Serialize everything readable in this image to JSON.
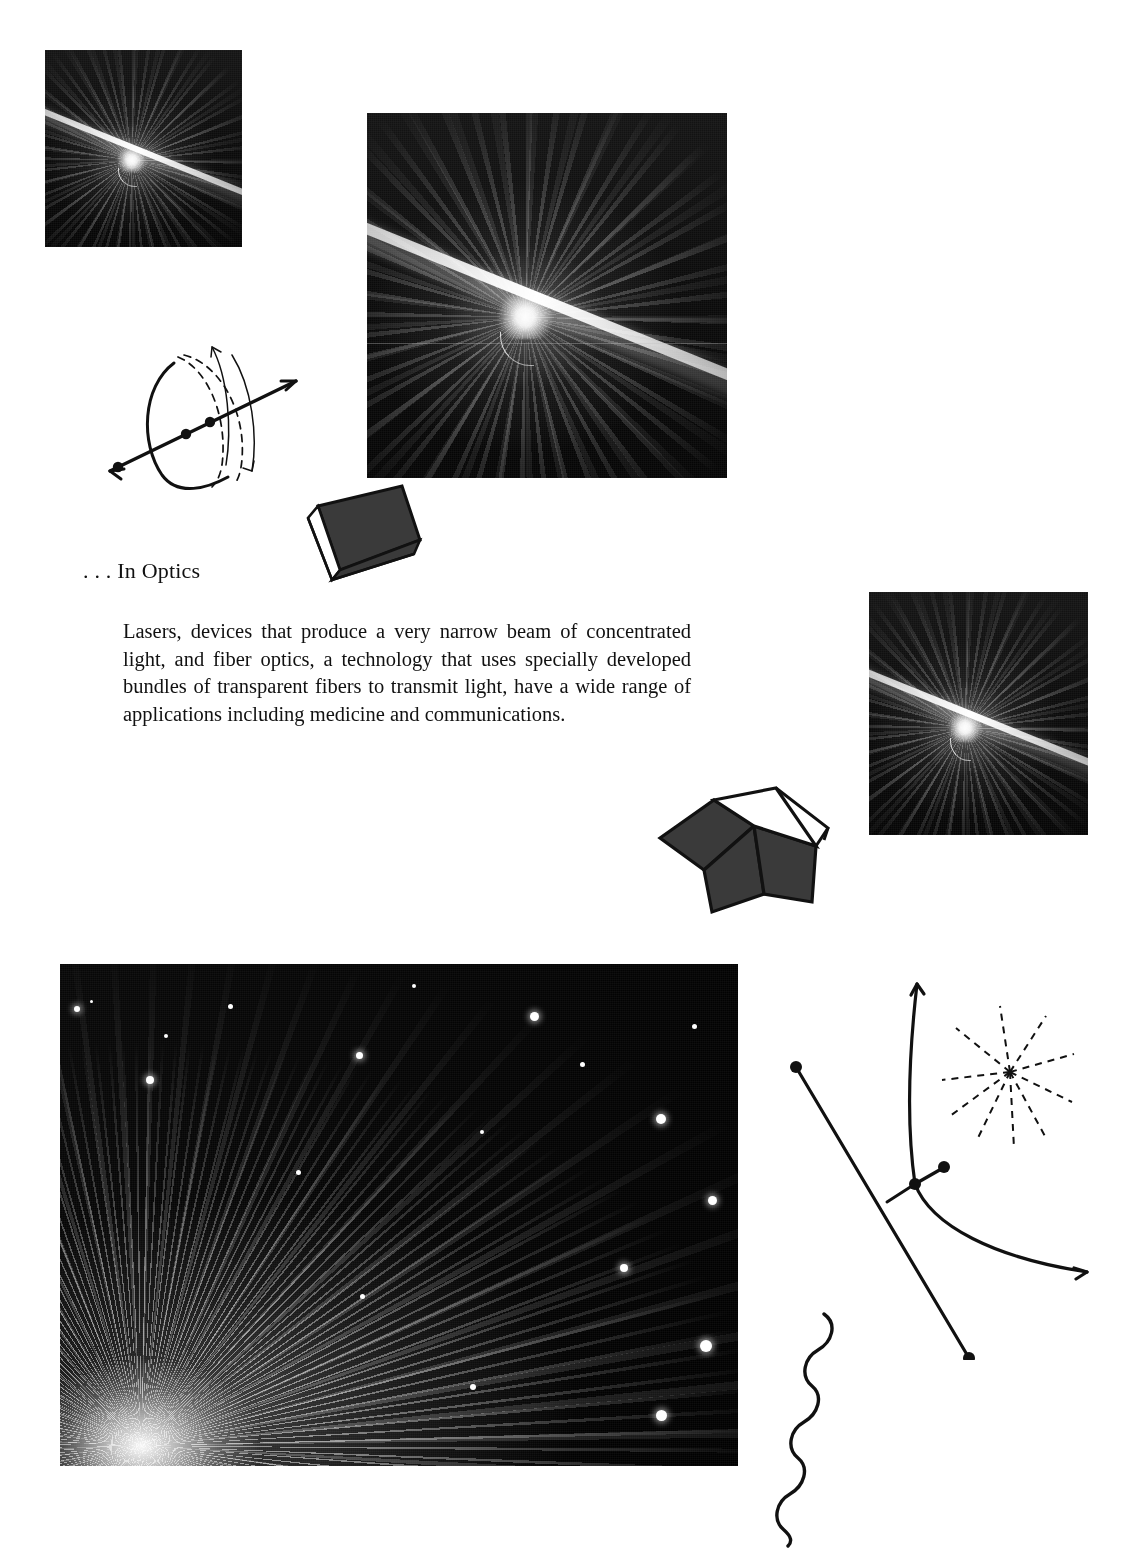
{
  "page": {
    "background_color": "#ffffff",
    "width": 1133,
    "height": 1568
  },
  "heading": {
    "text": ". . . In Optics"
  },
  "body": {
    "paragraph": "Lasers, devices that produce a very narrow beam of concentrated light, and fiber optics, a technology that uses specially developed bundles of transparent fibers to transmit light, have a wide range of applications including medicine and communications."
  },
  "figures": [
    {
      "id": "laser-photo-small",
      "caption": "",
      "description": "Laser beam striking a surface with radiating fan of light rays",
      "subject": "laser-beam",
      "x": 45,
      "y": 50,
      "width": 197,
      "height": 197
    },
    {
      "id": "laser-photo-large",
      "caption": "",
      "description": "Laser beam striking a surface with radiating fan of light rays",
      "subject": "laser-beam",
      "x": 367,
      "y": 113,
      "width": 360,
      "height": 365
    },
    {
      "id": "laser-photo-right",
      "caption": "",
      "description": "Laser beam striking a surface with radiating fan of light rays",
      "subject": "laser-beam",
      "x": 869,
      "y": 592,
      "width": 219,
      "height": 243
    },
    {
      "id": "fiber-optics-photo",
      "caption": "",
      "description": "Bundle of illuminated fiber optic strands spraying light from a point",
      "subject": "fiber-optics",
      "x": 60,
      "y": 964,
      "width": 678,
      "height": 502
    }
  ],
  "diagrams": [
    {
      "id": "sphere-axis-diagram",
      "name": "rotation-axis-diagram",
      "description": "Hand-drawn double-headed arrow axis through solid and dashed arcs with three marked points and two curved rotation arrows"
    },
    {
      "id": "wedge-prism",
      "name": "wedge-prism-shape",
      "description": "Dark shaded wedge / prism solid drawn in perspective with white underside"
    },
    {
      "id": "cube",
      "name": "cube-shape",
      "description": "Dark shaded cube drawn in perspective with open white top face"
    },
    {
      "id": "ray-curve-diagram",
      "name": "refraction-ray-diagram",
      "description": "Straight ray line with endpoint dots crossing a curved arrow with a perpendicular tick and normal segment"
    },
    {
      "id": "starburst",
      "name": "dashed-starburst",
      "description": "Dashed radial starburst of ten rays emanating from a central point"
    },
    {
      "id": "wave-squiggle",
      "name": "light-wave-squiggle",
      "description": "Hand-drawn sinusoidal wavy line representing a light wave"
    }
  ],
  "colors": {
    "ink": "#111111",
    "paper": "#ffffff",
    "shape_fill": "#3a3a3a",
    "photo_black": "#000000"
  }
}
